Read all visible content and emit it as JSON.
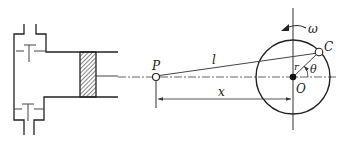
{
  "diagram": {
    "type": "slider-crank mechanism",
    "colors": {
      "stroke": "#222222",
      "thin": "#444444",
      "background": "#ffffff"
    },
    "labels": {
      "piston_pin": "P",
      "connecting_rod": "l",
      "crank_pin": "C",
      "crank_center": "O",
      "crank_radius": "r",
      "crank_angle": "θ",
      "angular_velocity": "ω",
      "displacement": "x"
    },
    "components": [
      {
        "name": "cylinder-head",
        "description": "cylinder head with intake and exhaust valves"
      },
      {
        "name": "piston",
        "description": "hatched piston in cylinder"
      },
      {
        "name": "connecting-rod",
        "from": "P",
        "to": "C"
      },
      {
        "name": "crank-circle",
        "center": "O"
      },
      {
        "name": "dimension-x",
        "from": "P",
        "to": "O"
      }
    ]
  }
}
